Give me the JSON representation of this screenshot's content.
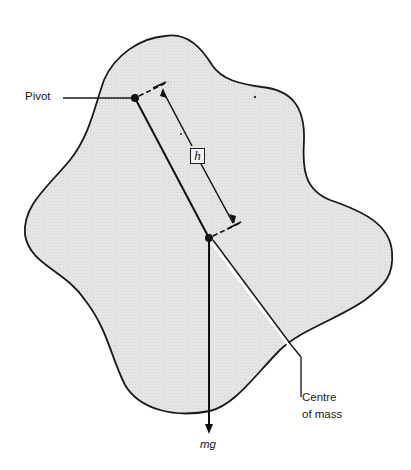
{
  "diagram": {
    "title": "",
    "labels": {
      "pivot": "Pivot",
      "distance": "h",
      "centre_of_mass_line1": "Centre",
      "centre_of_mass_line2": "of mass",
      "force": "mg"
    },
    "colors": {
      "body_fill": "#e6e6e6",
      "outline": "#1a1a1a",
      "background": "#ffffff"
    },
    "points": {
      "pivot": [
        135,
        98
      ],
      "centre_of_mass": [
        209,
        238
      ]
    }
  }
}
